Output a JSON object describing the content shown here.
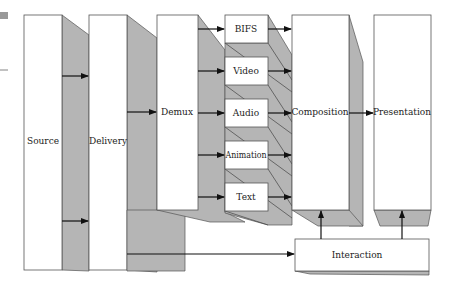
{
  "diagram": {
    "type": "block-diagram",
    "colors": {
      "box_fill": "#ffffff",
      "shadow_fill": "#b5b5b5",
      "stroke": "#555555",
      "arrow": "#111111"
    },
    "nodes": {
      "source": "Source",
      "delivery": "Delivery",
      "demux": "Demux",
      "bifs": "BIFS",
      "video": "Video",
      "audio": "Audio",
      "animation": "Animation",
      "text": "Text",
      "composition": "Composition",
      "presentation": "Presentation",
      "interaction": "Interaction"
    },
    "edges": [
      [
        "Source",
        "Delivery"
      ],
      [
        "Source",
        "Delivery"
      ],
      [
        "Delivery",
        "Demux"
      ],
      [
        "Delivery",
        "Interaction"
      ],
      [
        "Demux",
        "BIFS"
      ],
      [
        "Demux",
        "Video"
      ],
      [
        "Demux",
        "Audio"
      ],
      [
        "Demux",
        "Animation"
      ],
      [
        "Demux",
        "Text"
      ],
      [
        "BIFS",
        "Composition"
      ],
      [
        "Video",
        "Composition"
      ],
      [
        "Audio",
        "Composition"
      ],
      [
        "Animation",
        "Composition"
      ],
      [
        "Text",
        "Composition"
      ],
      [
        "Composition",
        "Presentation"
      ],
      [
        "Interaction",
        "Composition"
      ],
      [
        "Interaction",
        "Presentation"
      ]
    ]
  }
}
